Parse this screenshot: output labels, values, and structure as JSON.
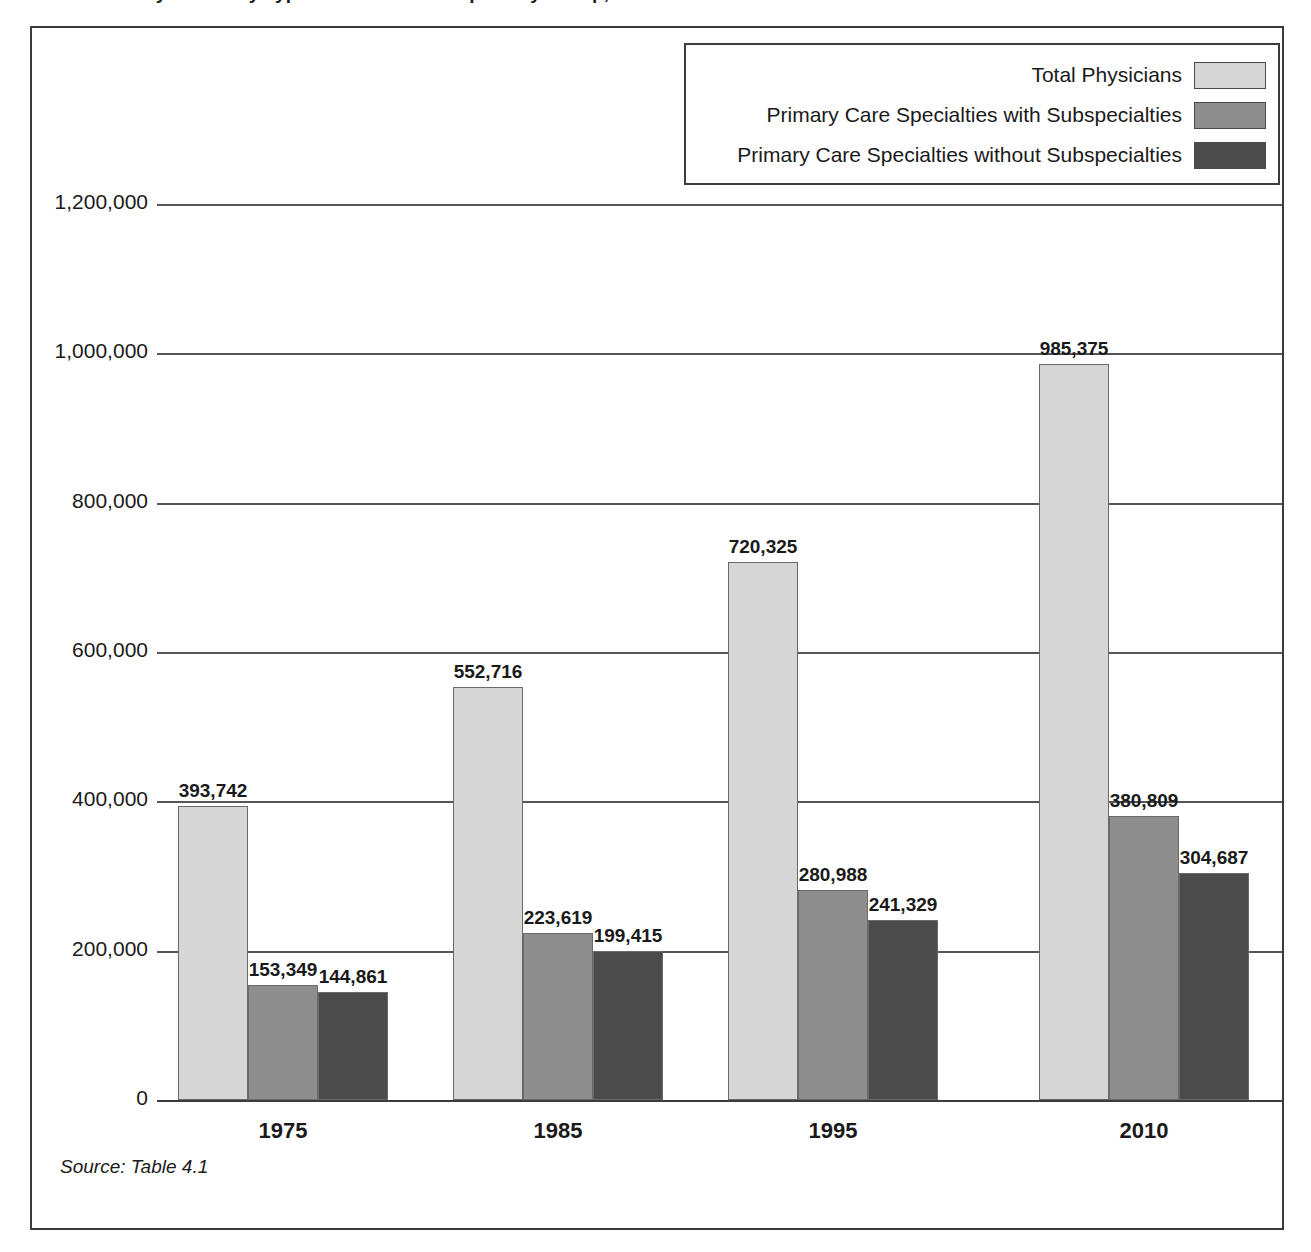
{
  "figure": {
    "title": "Number of Physicians by Type of Practice and Specialty Group, Selected Years",
    "source_note": "Source: Table 4.1"
  },
  "legend": {
    "entries": [
      {
        "label": "Total Physicians",
        "color": "#d6d6d6",
        "icon": "legend-swatch-light"
      },
      {
        "label": "Primary Care Specialties with Subspecialties",
        "color": "#8e8e8e",
        "icon": "legend-swatch-medium"
      },
      {
        "label": "Primary Care Specialties without Subspecialties",
        "color": "#4b4b4b",
        "icon": "legend-swatch-dark"
      }
    ]
  },
  "axes": {
    "y_ticks": [
      "0",
      "200,000",
      "400,000",
      "600,000",
      "800,000",
      "1,000,000",
      "1,200,000"
    ],
    "x_ticks": [
      "1975",
      "1985",
      "1995",
      "2010"
    ]
  },
  "chart_data": {
    "type": "bar",
    "title": "Number of Physicians by Type of Practice and Specialty Group, Selected Years",
    "xlabel": "",
    "ylabel": "",
    "ylim": [
      0,
      1200000
    ],
    "ytick_interval": 200000,
    "grid": true,
    "legend_position": "top-right",
    "categories": [
      "1975",
      "1985",
      "1995",
      "2010"
    ],
    "series": [
      {
        "name": "Total Physicians",
        "color": "#d6d6d6",
        "values": [
          393742,
          552716,
          720325,
          985375
        ],
        "labels": [
          "393,742",
          "552,716",
          "720,325",
          "985,375"
        ]
      },
      {
        "name": "Primary Care Specialties with Subspecialties",
        "color": "#8e8e8e",
        "values": [
          153349,
          223619,
          280988,
          380809
        ],
        "labels": [
          "153,349",
          "223,619",
          "280,988",
          "380,809"
        ]
      },
      {
        "name": "Primary Care Specialties without Subspecialties",
        "color": "#4b4b4b",
        "values": [
          144861,
          199415,
          241329,
          304687
        ],
        "labels": [
          "144,861",
          "199,415",
          "241,329",
          "304,687"
        ]
      }
    ]
  }
}
